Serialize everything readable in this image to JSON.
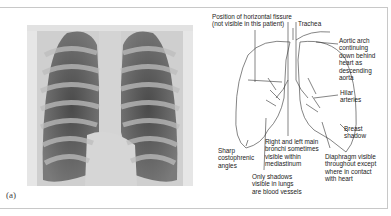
{
  "figure": {
    "panel_label": "(a)",
    "xray_alt": "Chest X-ray (posteroanterior view)",
    "labels": {
      "horizontal_fissure": "Position of horizontal fissure\n(not visible in this patient)",
      "trachea": "Trachea",
      "aortic_arch": "Aortic arch\ncontinuing\ndown behind\nheart as\ndescending\naorta",
      "hilar_arteries": "Hilar\narteries",
      "breast_shadow": "Breast\nshadow",
      "costophrenic": "Sharp\ncostophrenic\nangles",
      "bronchi": "Right and left main\nbronchi sometimes\nvisible within\nmediastinum",
      "diaphragm": "Diaphragm visible\nthroughout except\nwhere in contact\nwith heart",
      "blood_vessels": "Only shadows\nvisible in lungs\nare blood vessels"
    }
  }
}
